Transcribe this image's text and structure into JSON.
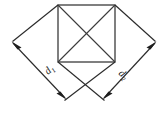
{
  "figure": {
    "background_color": "#ffffff",
    "line_color": "#2b2b2b",
    "label_color": "#1a1a1a"
  },
  "labels": {
    "d1": {
      "base": "d",
      "subscript": "1",
      "full": "d₁",
      "position": "left-lower",
      "rotation_deg": -42
    },
    "d2": {
      "base": "d",
      "subscript": "2",
      "full": "d₂",
      "position": "right-lower",
      "rotation_deg": 42
    }
  },
  "geometry": {
    "square": {
      "name": "inner-square",
      "top_left": [
        58,
        5
      ],
      "top_right": [
        115,
        5
      ],
      "bottom_right": [
        115,
        62
      ],
      "bottom_left": [
        58,
        62
      ],
      "diagonals": 2
    },
    "dimension_lines": [
      {
        "name": "d1-dimension-line",
        "from": [
          11,
          43
        ],
        "to": [
          66,
          99
        ],
        "arrowheads": "both"
      },
      {
        "name": "d2-dimension-line",
        "from": [
          157,
          43
        ],
        "to": [
          103,
          99
        ],
        "arrowheads": "both"
      }
    ],
    "rhombus_edges": [
      {
        "name": "edge-upper-left",
        "from": [
          58,
          5
        ],
        "to": [
          11,
          43
        ]
      },
      {
        "name": "edge-upper-right",
        "from": [
          115,
          5
        ],
        "to": [
          157,
          43
        ]
      },
      {
        "name": "edge-lower-left",
        "from": [
          58,
          62
        ],
        "to": [
          103,
          99
        ]
      },
      {
        "name": "edge-lower-right",
        "from": [
          115,
          62
        ],
        "to": [
          66,
          99
        ]
      }
    ]
  }
}
